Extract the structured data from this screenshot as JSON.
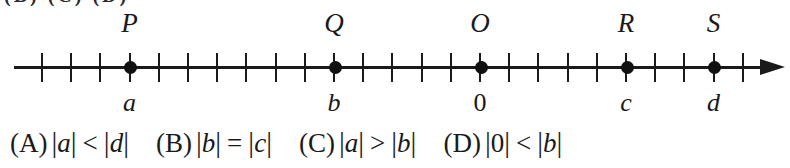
{
  "top_cut_text": "(B) (C) (D)",
  "number_line": {
    "axis_start_x": 14,
    "axis_end_x": 766,
    "tick_count": 25,
    "tick_start_x": 42,
    "tick_spacing": 29.2,
    "points": [
      {
        "name": "P",
        "top_label": "P",
        "bottom_label": "a",
        "bottom_italic": true,
        "tick_index": 3
      },
      {
        "name": "Q",
        "top_label": "Q",
        "bottom_label": "b",
        "bottom_italic": true,
        "tick_index": 10
      },
      {
        "name": "O",
        "top_label": "O",
        "bottom_label": "0",
        "bottom_italic": false,
        "tick_index": 15
      },
      {
        "name": "R",
        "top_label": "R",
        "bottom_label": "c",
        "bottom_italic": true,
        "tick_index": 20
      },
      {
        "name": "S",
        "top_label": "S",
        "bottom_label": "d",
        "bottom_italic": true,
        "tick_index": 23
      }
    ]
  },
  "choices": [
    {
      "key": "(A)",
      "left": "a",
      "left_upright": false,
      "relation": "<",
      "right": "d",
      "right_upright": false
    },
    {
      "key": "(B)",
      "left": "b",
      "left_upright": false,
      "relation": "=",
      "right": "c",
      "right_upright": false
    },
    {
      "key": "(C)",
      "left": "a",
      "left_upright": false,
      "relation": ">",
      "right": "b",
      "right_upright": false
    },
    {
      "key": "(D)",
      "left": "0",
      "left_upright": true,
      "relation": "<",
      "right": "b",
      "right_upright": false
    }
  ],
  "colors": {
    "ink": "#1a1a1a",
    "background": "#ffffff"
  }
}
